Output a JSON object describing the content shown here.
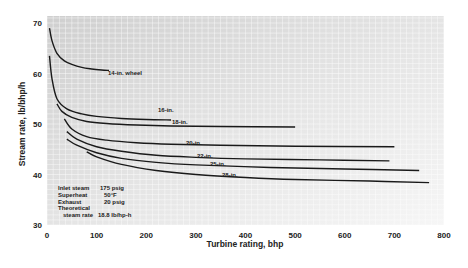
{
  "chart_data": {
    "type": "line",
    "title": "",
    "xlabel": "Turbine rating, bhp",
    "ylabel": "Stream rate, lb/bhp/h",
    "xlim": [
      0,
      800
    ],
    "ylim": [
      30,
      70
    ],
    "x_ticks": [
      "0",
      "100",
      "200",
      "300",
      "400",
      "500",
      "600",
      "700",
      "800"
    ],
    "y_ticks": [
      "30",
      "40",
      "50",
      "60",
      "70"
    ],
    "grid": true,
    "legend_position": "inline labels",
    "series": [
      {
        "name": "14-in. wheel",
        "x": [
          5,
          10,
          20,
          35,
          50,
          70,
          90,
          110,
          125
        ],
        "y": [
          69,
          66.5,
          64,
          62.5,
          61.8,
          61.2,
          60.9,
          60.7,
          60.6
        ]
      },
      {
        "name": "16-in.",
        "x": [
          5,
          10,
          20,
          40,
          70,
          100,
          150,
          200,
          250
        ],
        "y": [
          63.5,
          59,
          55,
          53,
          52,
          51.5,
          51.1,
          50.9,
          50.8
        ]
      },
      {
        "name": "18-in.",
        "x": [
          20,
          30,
          50,
          80,
          120,
          180,
          250,
          350,
          500
        ],
        "y": [
          54,
          52.5,
          51.3,
          50.5,
          50.1,
          49.8,
          49.6,
          49.5,
          49.4
        ]
      },
      {
        "name": "20-in.",
        "x": [
          35,
          50,
          80,
          120,
          180,
          250,
          350,
          500,
          700
        ],
        "y": [
          51,
          49,
          47.5,
          46.8,
          46.3,
          46,
          45.8,
          45.6,
          45.5
        ]
      },
      {
        "name": "22-in.",
        "x": [
          40,
          60,
          100,
          150,
          220,
          300,
          400,
          550,
          690
        ],
        "y": [
          48.5,
          47,
          45.5,
          44.6,
          43.8,
          43.4,
          43.1,
          42.9,
          42.7
        ]
      },
      {
        "name": "25-in.",
        "x": [
          40,
          60,
          100,
          150,
          220,
          300,
          450,
          600,
          750
        ],
        "y": [
          47,
          45.8,
          44.3,
          43.2,
          42.4,
          41.9,
          41.4,
          41.1,
          40.8
        ]
      },
      {
        "name": "28-in.",
        "x": [
          80,
          100,
          150,
          220,
          300,
          400,
          500,
          650,
          770
        ],
        "y": [
          44.5,
          43.5,
          42,
          40.8,
          40,
          39.4,
          39,
          38.7,
          38.4
        ]
      }
    ],
    "annotations": [
      {
        "label": "Inlet steam",
        "value": "175 psig"
      },
      {
        "label": "Superheat",
        "value": "50°F"
      },
      {
        "label": "Exhaust",
        "value": "20 psig"
      },
      {
        "label": "Theoretical",
        "value": ""
      },
      {
        "label": "steam rate",
        "value": "18.8 lb/hp-h"
      }
    ]
  }
}
